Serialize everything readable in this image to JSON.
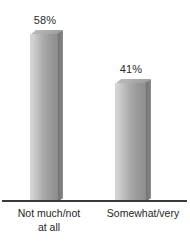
{
  "chart_data": {
    "type": "bar",
    "title": "",
    "subtitle": "",
    "xlabel": "",
    "ylabel": "",
    "grid": false,
    "legend": "none",
    "ylim": [
      0,
      63
    ],
    "categories": [
      "Not much/not\nat all",
      "Somewhat/very"
    ],
    "values": [
      58,
      41
    ],
    "value_labels": [
      "58%",
      "41%"
    ],
    "series": [
      {
        "name": "",
        "values": [
          58,
          41
        ]
      }
    ],
    "style": {
      "bar_face_light": "#d7d7d7",
      "bar_face_dark": "#8d8d8d",
      "bar_side": "#6f6f6f",
      "bar_top": "#b9b9b9",
      "axis_color": "#3a3a3a",
      "text_color": "#1f1f1f",
      "background": "#ffffff"
    }
  }
}
